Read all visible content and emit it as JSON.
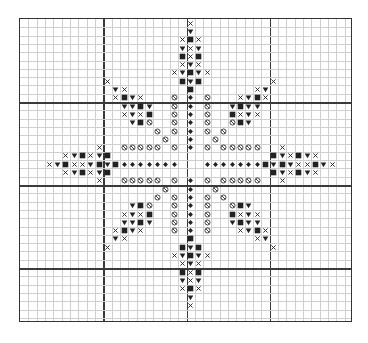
{
  "chart": {
    "cols": 40,
    "rows": 36.6,
    "major_every": 10,
    "cell_w": 8.325,
    "cell_h": 8.3,
    "center_col": 20,
    "center_row": 17,
    "colors": {
      "ink": "#222222",
      "grid": "#cfcfcf",
      "major": "#3a3a3a"
    }
  },
  "legend_symbols": {
    "X": "cross-stitch-x",
    "V": "triangle-down-solid",
    "S": "square-solid",
    "O": "circle-slash",
    "D": "diamond-solid"
  },
  "pattern_top_left_quadrant": [
    [
      0,
      20,
      "X"
    ],
    [
      1,
      20,
      "V"
    ],
    [
      2,
      19,
      "X"
    ],
    [
      2,
      20,
      "S"
    ],
    [
      3,
      19,
      "V"
    ],
    [
      3,
      20,
      "X"
    ],
    [
      4,
      19,
      "S"
    ],
    [
      4,
      20,
      "X"
    ],
    [
      5,
      19,
      "X"
    ],
    [
      5,
      20,
      "V"
    ],
    [
      6,
      18,
      "X"
    ],
    [
      6,
      19,
      "V"
    ],
    [
      6,
      20,
      "S"
    ],
    [
      7,
      10,
      "X"
    ],
    [
      7,
      19,
      "S"
    ],
    [
      7,
      20,
      "V"
    ],
    [
      8,
      11,
      "V"
    ],
    [
      8,
      12,
      "X"
    ],
    [
      8,
      20,
      "S"
    ],
    [
      9,
      11,
      "X"
    ],
    [
      9,
      12,
      "S"
    ],
    [
      9,
      13,
      "V"
    ],
    [
      9,
      14,
      "X"
    ],
    [
      9,
      18,
      "O"
    ],
    [
      9,
      20,
      "D"
    ],
    [
      10,
      12,
      "V"
    ],
    [
      10,
      13,
      "V"
    ],
    [
      10,
      14,
      "S"
    ],
    [
      10,
      15,
      "V"
    ],
    [
      10,
      18,
      "O"
    ],
    [
      10,
      20,
      "D"
    ],
    [
      11,
      12,
      "X"
    ],
    [
      11,
      13,
      "V"
    ],
    [
      11,
      14,
      "X"
    ],
    [
      11,
      15,
      "S"
    ],
    [
      11,
      18,
      "O"
    ],
    [
      11,
      20,
      "D"
    ],
    [
      12,
      13,
      "V"
    ],
    [
      12,
      14,
      "S"
    ],
    [
      12,
      15,
      "O"
    ],
    [
      12,
      18,
      "O"
    ],
    [
      12,
      20,
      "D"
    ],
    [
      13,
      16,
      "O"
    ],
    [
      13,
      18,
      "O"
    ],
    [
      13,
      20,
      "D"
    ],
    [
      14,
      17,
      "O"
    ],
    [
      14,
      20,
      "D"
    ],
    [
      15,
      9,
      "X"
    ],
    [
      15,
      12,
      "O"
    ],
    [
      15,
      13,
      "O"
    ],
    [
      15,
      14,
      "O"
    ],
    [
      15,
      15,
      "O"
    ],
    [
      15,
      16,
      "O"
    ],
    [
      15,
      18,
      "O"
    ],
    [
      15,
      20,
      "D"
    ],
    [
      16,
      5,
      "X"
    ],
    [
      16,
      6,
      "V"
    ],
    [
      16,
      7,
      "S"
    ],
    [
      16,
      8,
      "X"
    ],
    [
      16,
      9,
      "V"
    ],
    [
      16,
      10,
      "S"
    ],
    [
      17,
      3,
      "X"
    ],
    [
      17,
      4,
      "V"
    ],
    [
      17,
      5,
      "S"
    ],
    [
      17,
      6,
      "X"
    ],
    [
      17,
      7,
      "X"
    ],
    [
      17,
      8,
      "V"
    ],
    [
      17,
      9,
      "S"
    ],
    [
      17,
      10,
      "V"
    ],
    [
      17,
      11,
      "S"
    ],
    [
      17,
      12,
      "D"
    ],
    [
      17,
      13,
      "D"
    ],
    [
      17,
      14,
      "D"
    ],
    [
      17,
      15,
      "D"
    ],
    [
      17,
      16,
      "D"
    ],
    [
      17,
      17,
      "D"
    ],
    [
      17,
      18,
      "D"
    ]
  ],
  "symmetry": "mirror across center column 20 and center row 17"
}
